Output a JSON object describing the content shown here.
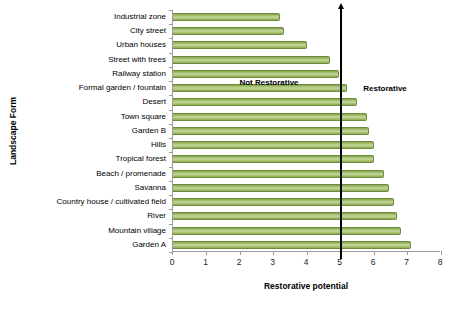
{
  "chart_data": {
    "type": "bar",
    "orientation": "horizontal",
    "title": "",
    "xlabel": "Restorative potential",
    "ylabel": "Landscape Form",
    "xlim": [
      0,
      8
    ],
    "xticks": [
      0,
      1,
      2,
      3,
      4,
      5,
      6,
      7,
      8
    ],
    "grid": false,
    "legend": false,
    "categories": [
      "Industrial zone",
      "City street",
      "Urban houses",
      "Street with trees",
      "Railway station",
      "Formal garden / fountain",
      "Desert",
      "Town square",
      "Garden B",
      "Hills",
      "Tropical forest",
      "Beach / promenade",
      "Savanna",
      "Country house / cultivated field",
      "River",
      "Mountain village",
      "Garden A"
    ],
    "values": [
      3.2,
      3.3,
      4.0,
      4.7,
      4.95,
      5.2,
      5.5,
      5.8,
      5.85,
      6.0,
      6.0,
      6.3,
      6.45,
      6.6,
      6.7,
      6.8,
      7.1
    ],
    "bar_color": "#9bbb59",
    "bar_border_color": "#6d8a3e",
    "axis_color": "#9b9b9b",
    "reference_line": {
      "value": 5,
      "color": "#000000",
      "label_left": "Not Restorative",
      "label_right": "Restorative"
    }
  }
}
